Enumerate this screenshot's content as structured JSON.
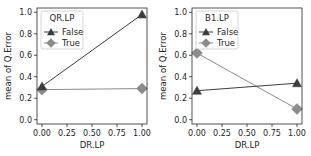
{
  "chart_data": [
    {
      "type": "line",
      "title": "",
      "xlabel": "DR.LP",
      "ylabel": "mean of Q.Error",
      "x": [
        0,
        1
      ],
      "xticks": [
        "0.00",
        "0.25",
        "0.50",
        "0.75",
        "1.00"
      ],
      "yticks": [
        "0.0",
        "0.2",
        "0.4",
        "0.6",
        "0.8",
        "1.0"
      ],
      "xlim": [
        -0.05,
        1.05
      ],
      "ylim": [
        -0.04,
        1.04
      ],
      "grid": false,
      "legend": {
        "title": "QR.LP",
        "position": "upper left"
      },
      "series": [
        {
          "name": "False",
          "marker": "triangle",
          "color": "#3d3d3d",
          "values": [
            0.31,
            0.98
          ]
        },
        {
          "name": "True",
          "marker": "diamond",
          "color": "#8c8c8c",
          "values": [
            0.28,
            0.29
          ]
        }
      ]
    },
    {
      "type": "line",
      "title": "",
      "xlabel": "DR.LP",
      "ylabel": "mean of Q.Error",
      "x": [
        0,
        1
      ],
      "xticks": [
        "0.00",
        "0.25",
        "0.50",
        "0.75",
        "1.00"
      ],
      "yticks": [
        "0.0",
        "0.2",
        "0.4",
        "0.6",
        "0.8",
        "1.0"
      ],
      "xlim": [
        -0.05,
        1.05
      ],
      "ylim": [
        -0.04,
        1.04
      ],
      "grid": false,
      "legend": {
        "title": "B1.LP",
        "position": "upper left"
      },
      "series": [
        {
          "name": "False",
          "marker": "triangle",
          "color": "#3d3d3d",
          "values": [
            0.27,
            0.34
          ]
        },
        {
          "name": "True",
          "marker": "diamond",
          "color": "#8c8c8c",
          "values": [
            0.62,
            0.1
          ]
        }
      ]
    }
  ],
  "panels": [
    {
      "xlabel": "DR.LP",
      "ylabel": "mean of Q.Error",
      "legend_title": "QR.LP",
      "legend_items": [
        "False",
        "True"
      ]
    },
    {
      "xlabel": "DR.LP",
      "ylabel": "mean of Q.Error",
      "legend_title": "B1.LP",
      "legend_items": [
        "False",
        "True"
      ]
    }
  ]
}
